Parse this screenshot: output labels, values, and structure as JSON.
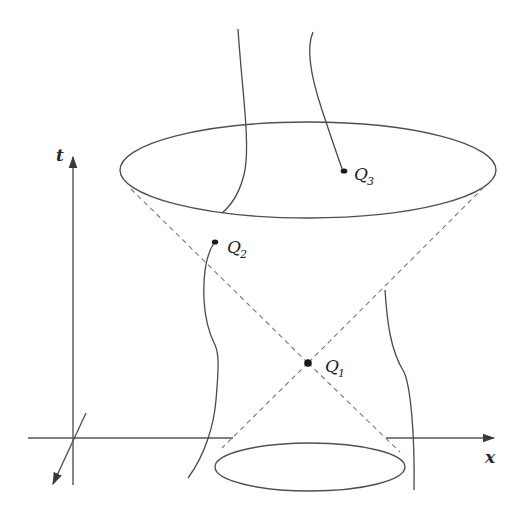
{
  "figure": {
    "axes": {
      "t_label": "t",
      "x_label": "x"
    },
    "events": [
      {
        "id": "Q1",
        "letter": "Q",
        "subscript": "1"
      },
      {
        "id": "Q2",
        "letter": "Q",
        "subscript": "2"
      },
      {
        "id": "Q3",
        "letter": "Q",
        "subscript": "3"
      }
    ],
    "colors": {
      "line": "#4a4a4a",
      "dashed_cone": "#7a7a7a",
      "dot": "#1a1a1a",
      "background": "#ffffff"
    }
  }
}
